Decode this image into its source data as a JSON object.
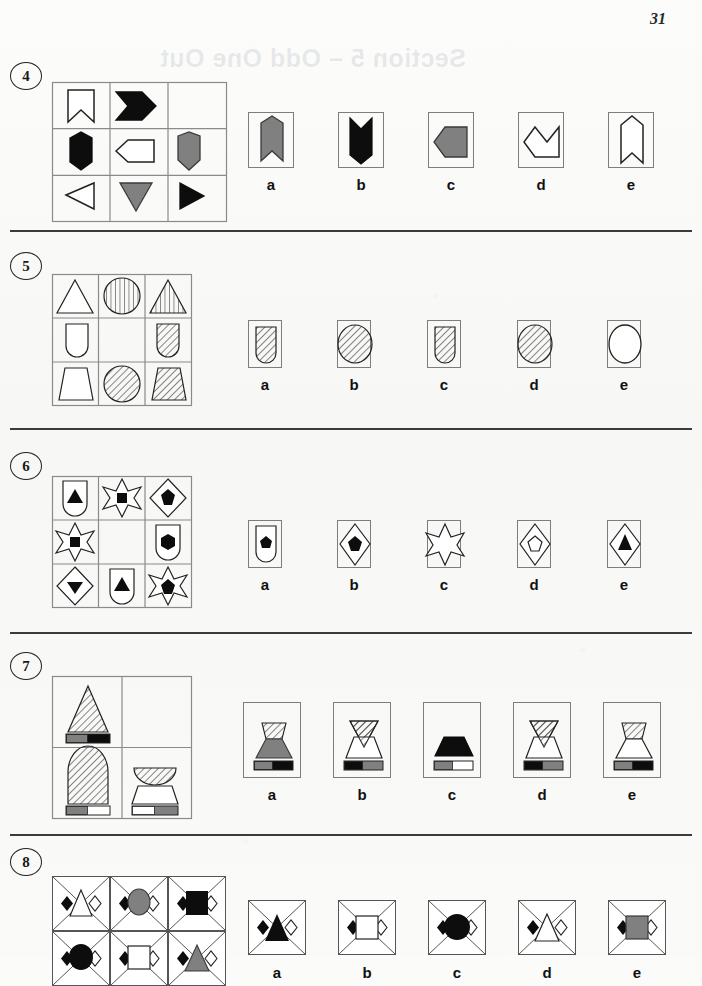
{
  "page": {
    "number": "31",
    "bleed_through_header": "Section 5 – Odd One Out",
    "background_color": "#fbfbfa",
    "ink_color": "#111111",
    "grey_fill": "#808080",
    "black_fill": "#0d0d0d",
    "white_fill": "#ffffff"
  },
  "option_labels": [
    "a",
    "b",
    "c",
    "d",
    "e"
  ],
  "questions": [
    {
      "number": "4",
      "theme": "arrow-and-pennant-shapes",
      "grid": {
        "rows": 3,
        "cols": 3,
        "cells": [
          {
            "shape": "chevron-notched-pennant-down",
            "fill": "white",
            "rot": 0
          },
          {
            "shape": "chevron-block-right",
            "fill": "black",
            "rot": 0
          },
          {
            "shape": "empty",
            "fill": "none",
            "rot": 0
          },
          {
            "shape": "pentagon-home-down",
            "fill": "black",
            "rot": 0
          },
          {
            "shape": "pentagon-home-left",
            "fill": "white",
            "rot": 0
          },
          {
            "shape": "pentagon-home-down",
            "fill": "grey",
            "rot": 0
          },
          {
            "shape": "triangle-left",
            "fill": "white",
            "rot": 0
          },
          {
            "shape": "triangle-down",
            "fill": "grey",
            "rot": 0
          },
          {
            "shape": "triangle-right",
            "fill": "black",
            "rot": 0
          }
        ]
      },
      "options": [
        {
          "label": "a",
          "shape": "pennant-notched-up",
          "fill": "grey"
        },
        {
          "label": "b",
          "shape": "pennant-notched-down",
          "fill": "black"
        },
        {
          "label": "c",
          "shape": "chevron-block-left",
          "fill": "grey"
        },
        {
          "label": "d",
          "shape": "chevron-block-left",
          "fill": "white"
        },
        {
          "label": "e",
          "shape": "pennant-notched-up",
          "fill": "white"
        }
      ]
    },
    {
      "number": "5",
      "theme": "hatched-outline-shapes",
      "grid": {
        "rows": 3,
        "cols": 3,
        "cells": [
          {
            "shape": "triangle-up",
            "fill": "plain"
          },
          {
            "shape": "circle",
            "fill": "vertical-hatch"
          },
          {
            "shape": "triangle-up",
            "fill": "vertical-hatch"
          },
          {
            "shape": "dome-up",
            "fill": "plain"
          },
          {
            "shape": "empty",
            "fill": "none"
          },
          {
            "shape": "dome-up",
            "fill": "diagonal-hatch"
          },
          {
            "shape": "trapezoid",
            "fill": "plain"
          },
          {
            "shape": "circle",
            "fill": "diagonal-hatch"
          },
          {
            "shape": "trapezoid",
            "fill": "diagonal-hatch"
          }
        ]
      },
      "options": [
        {
          "label": "a",
          "shape": "dome-up",
          "fill": "diagonal-hatch"
        },
        {
          "label": "b",
          "shape": "circle",
          "fill": "diagonal-hatch"
        },
        {
          "label": "c",
          "shape": "dome-up",
          "fill": "diagonal-hatch"
        },
        {
          "label": "d",
          "shape": "circle",
          "fill": "diagonal-hatch"
        },
        {
          "label": "e",
          "shape": "circle",
          "fill": "plain"
        }
      ]
    },
    {
      "number": "6",
      "theme": "outer-shape-with-inner-black-shape",
      "grid": {
        "rows": 3,
        "cols": 3,
        "cells": [
          {
            "outer": "dome-up",
            "inner": "triangle-up"
          },
          {
            "outer": "star6",
            "inner": "square"
          },
          {
            "outer": "diamond",
            "inner": "pentagon"
          },
          {
            "outer": "star6",
            "inner": "square"
          },
          {
            "outer": "empty",
            "inner": "none"
          },
          {
            "outer": "dome-up",
            "inner": "hexagon"
          },
          {
            "outer": "diamond",
            "inner": "triangle-down"
          },
          {
            "outer": "dome-up",
            "inner": "triangle-up"
          },
          {
            "outer": "star6",
            "inner": "pentagon"
          }
        ]
      },
      "options": [
        {
          "label": "a",
          "outer": "dome-up",
          "inner": "pentagon",
          "inner_fill": "black"
        },
        {
          "label": "b",
          "outer": "diamond",
          "inner": "pentagon",
          "inner_fill": "black"
        },
        {
          "label": "c",
          "outer": "star6",
          "inner": "none",
          "inner_fill": "none"
        },
        {
          "label": "d",
          "outer": "diamond",
          "inner": "pentagon",
          "inner_fill": "white"
        },
        {
          "label": "e",
          "outer": "diamond",
          "inner": "triangle-up",
          "inner_fill": "black"
        }
      ]
    },
    {
      "number": "7",
      "theme": "hatched-shape-over-base-with-two-tone-bar",
      "grid": {
        "rows": 2,
        "cols": 2,
        "cells": [
          {
            "shape": "tall-triangle-hatched",
            "base": "none",
            "bar": [
              "grey",
              "black"
            ]
          },
          {
            "shape": "empty",
            "base": "none",
            "bar": []
          },
          {
            "shape": "tall-dome-hatched",
            "base": "none",
            "bar": [
              "grey",
              "white"
            ]
          },
          {
            "shape": "bowl-hatched",
            "base": "trapezoid",
            "bar": [
              "white",
              "grey"
            ]
          }
        ]
      },
      "options": [
        {
          "label": "a",
          "top": "hatched-trapezoid-wide",
          "base_fill": "grey",
          "bar": [
            "grey",
            "black"
          ]
        },
        {
          "label": "b",
          "top": "hatched-triangle-down",
          "base_fill": "white",
          "bar": [
            "black",
            "grey"
          ]
        },
        {
          "label": "c",
          "top": "none",
          "base_fill": "black",
          "bar": [
            "grey",
            "white"
          ]
        },
        {
          "label": "d",
          "top": "hatched-triangle-down",
          "base_fill": "white",
          "bar": [
            "black",
            "grey"
          ]
        },
        {
          "label": "e",
          "top": "hatched-trapezoid-wide",
          "base_fill": "white",
          "bar": [
            "grey",
            "black"
          ]
        }
      ]
    },
    {
      "number": "8",
      "theme": "framed-diamond-corners-with-centre-shape",
      "grid": {
        "rows": 2,
        "cols": 3,
        "cells": [
          {
            "centre": "triangle-up",
            "centre_fill": "white"
          },
          {
            "centre": "ellipse",
            "centre_fill": "grey"
          },
          {
            "centre": "square",
            "centre_fill": "black"
          },
          {
            "centre": "ellipse",
            "centre_fill": "black"
          },
          {
            "centre": "square",
            "centre_fill": "white"
          },
          {
            "centre": "triangle-up",
            "centre_fill": "grey"
          }
        ]
      },
      "options": [
        {
          "label": "a",
          "centre": "triangle-up",
          "centre_fill": "black"
        },
        {
          "label": "b",
          "centre": "square",
          "centre_fill": "white"
        },
        {
          "label": "c",
          "centre": "ellipse",
          "centre_fill": "black"
        },
        {
          "label": "d",
          "centre": "triangle-up",
          "centre_fill": "white"
        },
        {
          "label": "e",
          "centre": "square",
          "centre_fill": "grey"
        }
      ]
    }
  ]
}
